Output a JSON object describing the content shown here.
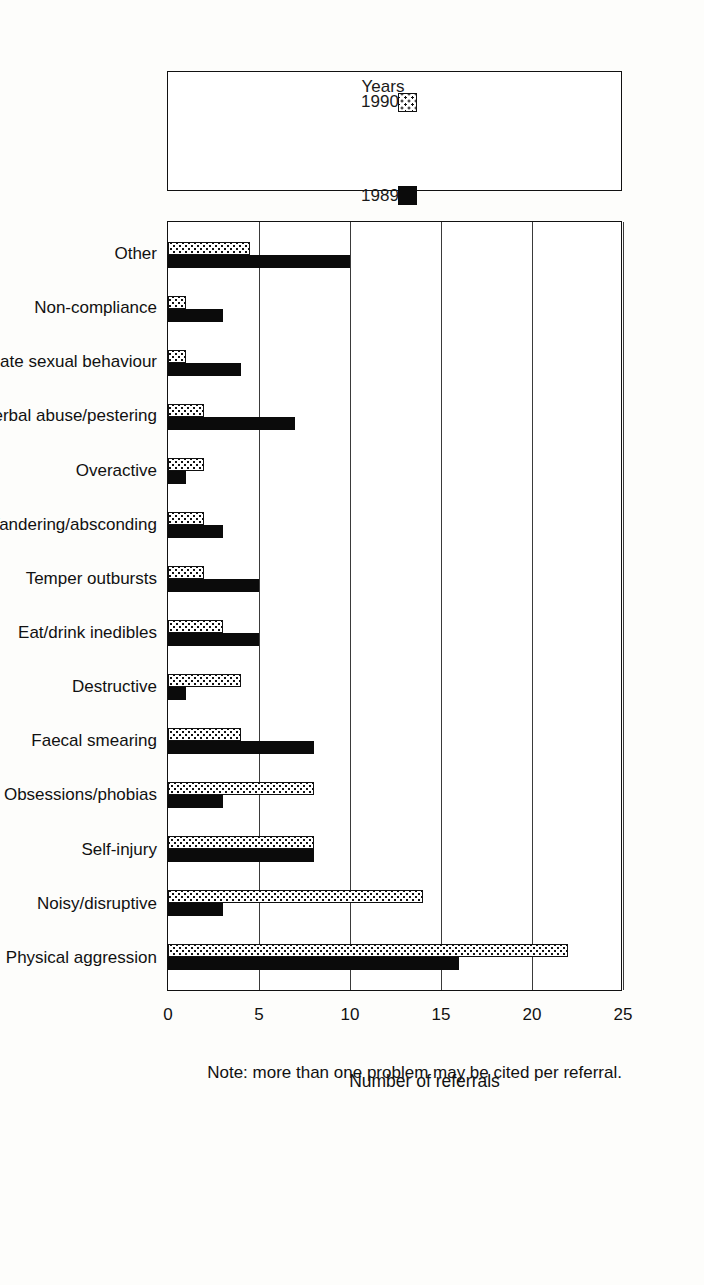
{
  "chart_data": {
    "type": "bar",
    "orientation": "horizontal",
    "title": "",
    "xlabel": "Number of referrals",
    "ylabel": "",
    "xlim": [
      0,
      25
    ],
    "ticks": [
      "0",
      "5",
      "10",
      "15",
      "20",
      "25"
    ],
    "tick_values": [
      0,
      5,
      10,
      15,
      20,
      25
    ],
    "grid": true,
    "legend_title": "Years",
    "legend_position": "top-left",
    "note": "Note: more than one problem may be cited per referral.",
    "categories": [
      "Other",
      "Non-compliance",
      "Inappropriate sexual behaviour",
      "Verbal abuse/pestering",
      "Overactive",
      "Wandering/absconding",
      "Temper outbursts",
      "Eat/drink inedibles",
      "Destructive",
      "Faecal smearing",
      "Obsessions/phobias",
      "Self-injury",
      "Noisy/disruptive",
      "Physical aggression"
    ],
    "series": [
      {
        "name": "1989",
        "fill": "solid-black",
        "color": "#0b0b0b",
        "values": [
          10,
          3,
          4,
          7,
          1,
          3,
          5,
          5,
          1,
          8,
          3,
          8,
          3,
          16
        ]
      },
      {
        "name": "1990",
        "fill": "dotted-white",
        "color": "#ffffff",
        "values": [
          4.5,
          1,
          1,
          2,
          2,
          2,
          2,
          3,
          4,
          4,
          8,
          8,
          14,
          22
        ]
      }
    ]
  }
}
